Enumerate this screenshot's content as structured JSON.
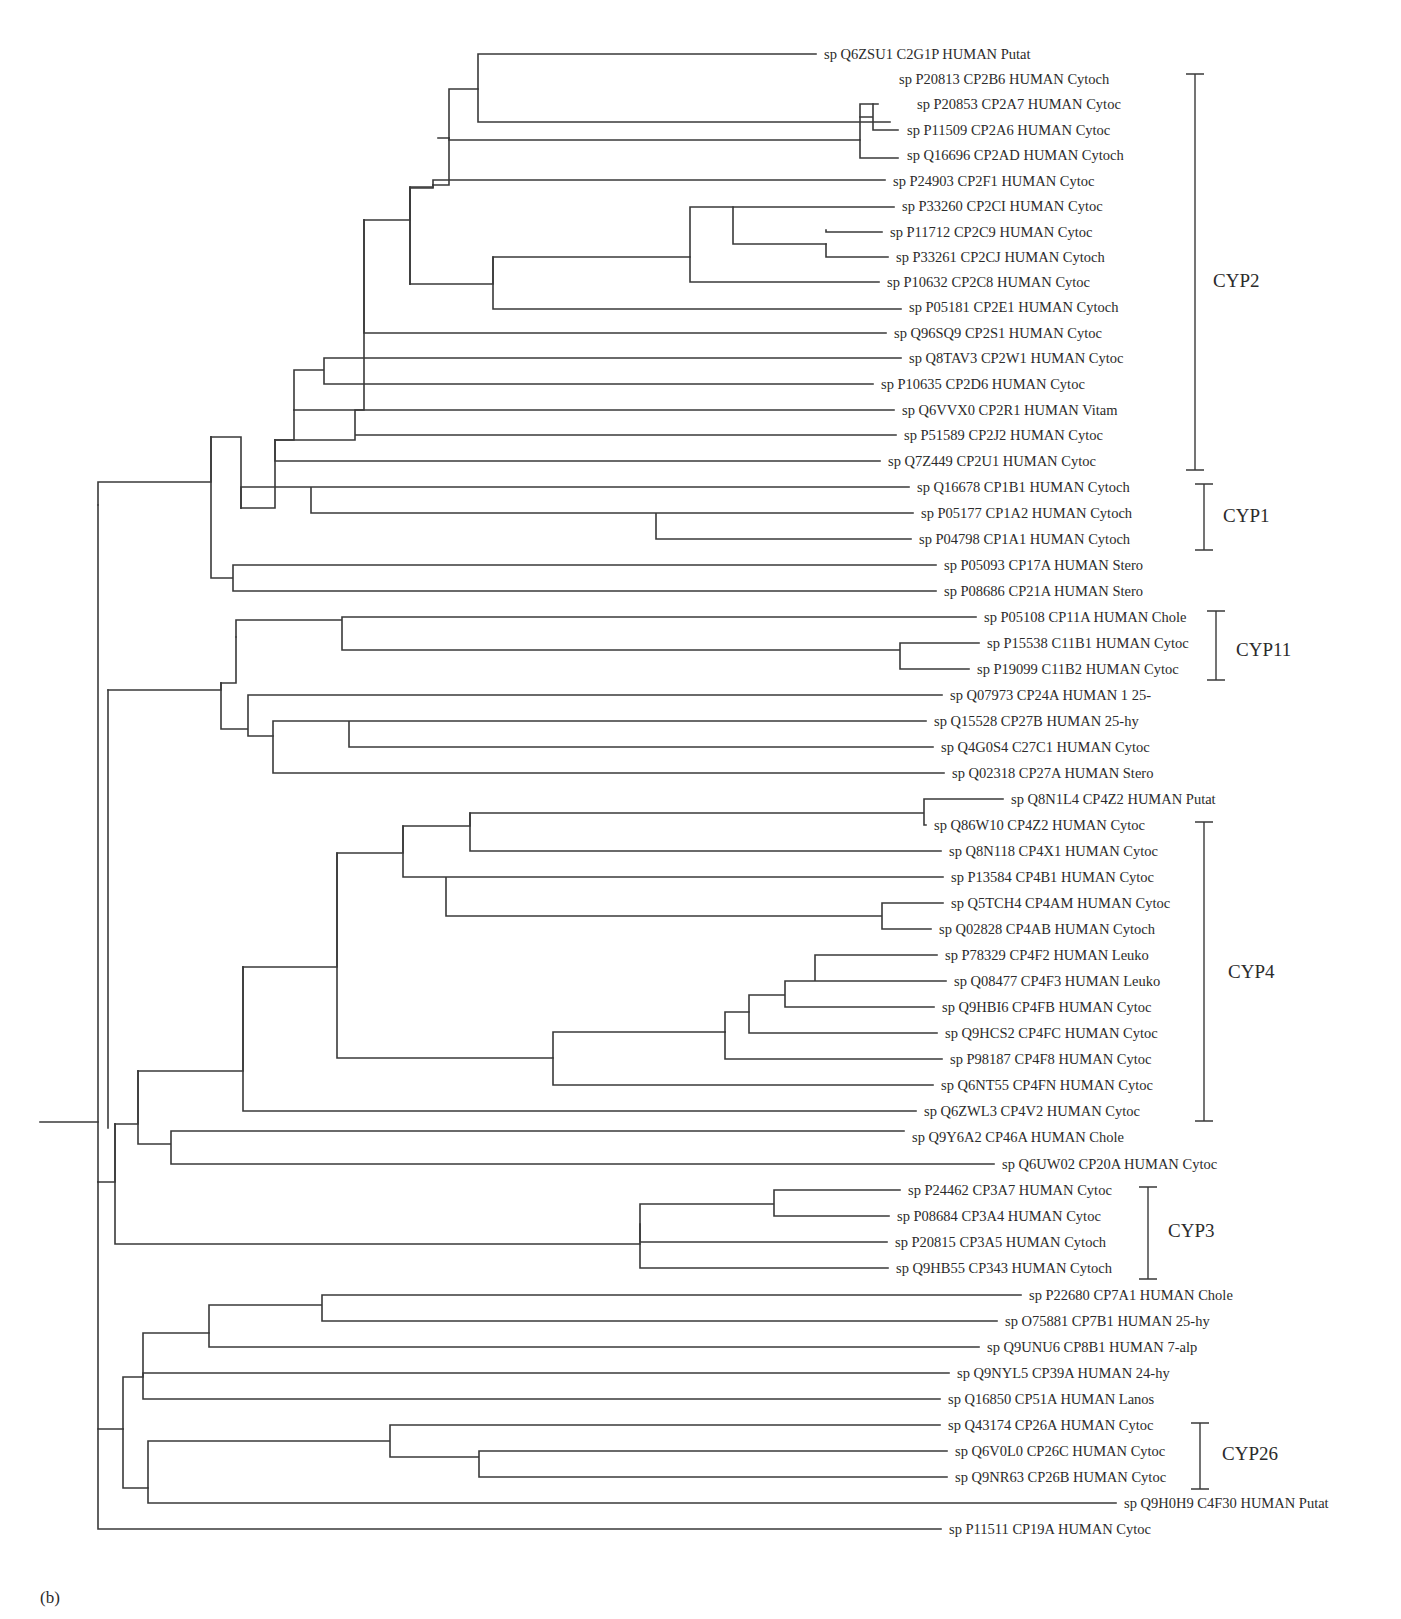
{
  "figure": {
    "panel_label": "(b)",
    "type": "phylogenetic-tree",
    "leaves": [
      {
        "id": "L0",
        "label": "sp Q6ZSU1 C2G1P HUMAN Putat",
        "y": 54,
        "x_end": 820
      },
      {
        "id": "L1",
        "label": "sp P20813 CP2B6 HUMAN Cytoch",
        "y": 79,
        "x_end": 895
      },
      {
        "id": "L2",
        "label": "sp P20853 CP2A7 HUMAN Cytoc",
        "y": 104,
        "x_end": 913
      },
      {
        "id": "L3",
        "label": "sp P11509 CP2A6 HUMAN Cytoc",
        "y": 130,
        "x_end": 903
      },
      {
        "id": "L4",
        "label": "sp Q16696 CP2AD HUMAN Cytoch",
        "y": 155,
        "x_end": 903
      },
      {
        "id": "L5",
        "label": "sp P24903 CP2F1 HUMAN Cytoc",
        "y": 181,
        "x_end": 889
      },
      {
        "id": "L6",
        "label": "sp P33260 CP2CI HUMAN Cytoc",
        "y": 206,
        "x_end": 898
      },
      {
        "id": "L7",
        "label": "sp P11712 CP2C9 HUMAN Cytoc",
        "y": 232,
        "x_end": 886
      },
      {
        "id": "L8",
        "label": "sp P33261 CP2CJ HUMAN Cytoch",
        "y": 257,
        "x_end": 892
      },
      {
        "id": "L9",
        "label": "sp P10632 CP2C8 HUMAN Cytoc",
        "y": 282,
        "x_end": 883
      },
      {
        "id": "L10",
        "label": "sp P05181 CP2E1 HUMAN Cytoch",
        "y": 307,
        "x_end": 905
      },
      {
        "id": "L11",
        "label": "sp Q96SQ9 CP2S1 HUMAN Cytoc",
        "y": 333,
        "x_end": 890
      },
      {
        "id": "L12",
        "label": "sp Q8TAV3 CP2W1 HUMAN Cytoc",
        "y": 358,
        "x_end": 905
      },
      {
        "id": "L13",
        "label": "sp P10635 CP2D6 HUMAN Cytoc",
        "y": 384,
        "x_end": 877
      },
      {
        "id": "L14",
        "label": "sp Q6VVX0 CP2R1 HUMAN Vitam",
        "y": 410,
        "x_end": 898
      },
      {
        "id": "L15",
        "label": "sp P51589 CP2J2 HUMAN Cytoc",
        "y": 435,
        "x_end": 900
      },
      {
        "id": "L16",
        "label": "sp Q7Z449 CP2U1 HUMAN Cytoc",
        "y": 461,
        "x_end": 884
      },
      {
        "id": "L17",
        "label": "sp Q16678 CP1B1 HUMAN Cytoch",
        "y": 487,
        "x_end": 913
      },
      {
        "id": "L18",
        "label": "sp P05177 CP1A2 HUMAN Cytoch",
        "y": 513,
        "x_end": 917
      },
      {
        "id": "L19",
        "label": "sp P04798 CP1A1 HUMAN Cytoch",
        "y": 539,
        "x_end": 915
      },
      {
        "id": "L20",
        "label": "sp P05093 CP17A HUMAN Stero",
        "y": 565,
        "x_end": 940
      },
      {
        "id": "L21",
        "label": "sp P08686 CP21A HUMAN Stero",
        "y": 591,
        "x_end": 940
      },
      {
        "id": "L22",
        "label": "sp P05108 CP11A HUMAN Chole",
        "y": 617,
        "x_end": 980
      },
      {
        "id": "L23",
        "label": "sp P15538 C11B1 HUMAN Cytoc",
        "y": 643,
        "x_end": 983
      },
      {
        "id": "L24",
        "label": "sp P19099 C11B2 HUMAN Cytoc",
        "y": 669,
        "x_end": 973
      },
      {
        "id": "L25",
        "label": "sp Q07973 CP24A HUMAN 1 25-",
        "y": 695,
        "x_end": 946
      },
      {
        "id": "L26",
        "label": "sp Q15528 CP27B HUMAN 25-hy",
        "y": 721,
        "x_end": 930
      },
      {
        "id": "L27",
        "label": "sp Q4G0S4 C27C1 HUMAN Cytoc",
        "y": 747,
        "x_end": 937
      },
      {
        "id": "L28",
        "label": "sp Q02318 CP27A HUMAN Stero",
        "y": 773,
        "x_end": 948
      },
      {
        "id": "L29",
        "label": "sp Q8N1L4 CP4Z2 HUMAN Putat",
        "y": 799,
        "x_end": 1007
      },
      {
        "id": "L30",
        "label": "sp Q86W10 CP4Z2 HUMAN Cytoc",
        "y": 825,
        "x_end": 930
      },
      {
        "id": "L31",
        "label": "sp Q8N118 CP4X1 HUMAN Cytoc",
        "y": 851,
        "x_end": 945
      },
      {
        "id": "L32",
        "label": "sp P13584 CP4B1 HUMAN Cytoc",
        "y": 877,
        "x_end": 947
      },
      {
        "id": "L33",
        "label": "sp Q5TCH4 CP4AM HUMAN Cytoc",
        "y": 903,
        "x_end": 947
      },
      {
        "id": "L34",
        "label": "sp Q02828 CP4AB HUMAN Cytoch",
        "y": 929,
        "x_end": 935
      },
      {
        "id": "L35",
        "label": "sp P78329 CP4F2 HUMAN Leuko",
        "y": 955,
        "x_end": 941
      },
      {
        "id": "L36",
        "label": "sp Q08477 CP4F3 HUMAN Leuko",
        "y": 981,
        "x_end": 950
      },
      {
        "id": "L37",
        "label": "sp Q9HBI6 CP4FB HUMAN Cytoc",
        "y": 1007,
        "x_end": 938
      },
      {
        "id": "L38",
        "label": "sp Q9HCS2 CP4FC HUMAN Cytoc",
        "y": 1033,
        "x_end": 941
      },
      {
        "id": "L39",
        "label": "sp P98187 CP4F8 HUMAN Cytoc",
        "y": 1059,
        "x_end": 946
      },
      {
        "id": "L40",
        "label": "sp Q6NT55 CP4FN HUMAN Cytoc",
        "y": 1085,
        "x_end": 937
      },
      {
        "id": "L41",
        "label": "sp Q6ZWL3 CP4V2 HUMAN Cytoc",
        "y": 1111,
        "x_end": 920
      },
      {
        "id": "L42",
        "label": "sp Q9Y6A2 CP46A HUMAN Chole",
        "y": 1137,
        "x_end": 908
      },
      {
        "id": "L43",
        "label": "sp Q6UW02 CP20A HUMAN Cytoc",
        "y": 1164,
        "x_end": 998
      },
      {
        "id": "L44",
        "label": "sp P24462 CP3A7 HUMAN Cytoc",
        "y": 1190,
        "x_end": 904
      },
      {
        "id": "L45",
        "label": "sp P08684 CP3A4 HUMAN Cytoc",
        "y": 1216,
        "x_end": 893
      },
      {
        "id": "L46",
        "label": "sp P20815 CP3A5 HUMAN Cytoch",
        "y": 1242,
        "x_end": 891
      },
      {
        "id": "L47",
        "label": "sp Q9HB55 CP343 HUMAN Cytoch",
        "y": 1268,
        "x_end": 892
      },
      {
        "id": "L48",
        "label": "sp P22680 CP7A1 HUMAN Chole",
        "y": 1295,
        "x_end": 1025
      },
      {
        "id": "L49",
        "label": "sp O75881 CP7B1 HUMAN 25-hy",
        "y": 1321,
        "x_end": 1001
      },
      {
        "id": "L50",
        "label": "sp Q9UNU6 CP8B1 HUMAN 7-alp",
        "y": 1347,
        "x_end": 983
      },
      {
        "id": "L51",
        "label": "sp Q9NYL5 CP39A HUMAN 24-hy",
        "y": 1373,
        "x_end": 953
      },
      {
        "id": "L52",
        "label": "sp Q16850 CP51A HUMAN Lanos",
        "y": 1399,
        "x_end": 944
      },
      {
        "id": "L53",
        "label": "sp Q43174 CP26A HUMAN Cytoc",
        "y": 1425,
        "x_end": 944
      },
      {
        "id": "L54",
        "label": "sp Q6V0L0 CP26C HUMAN Cytoc",
        "y": 1451,
        "x_end": 951
      },
      {
        "id": "L55",
        "label": "sp Q9NR63 CP26B HUMAN Cytoc",
        "y": 1477,
        "x_end": 951
      },
      {
        "id": "L56",
        "label": "sp Q9H0H9 C4F30 HUMAN Putat",
        "y": 1503,
        "x_end": 1120
      },
      {
        "id": "L57",
        "label": "sp P11511 CP19A HUMAN Cytoc",
        "y": 1529,
        "x_end": 945
      }
    ],
    "clades": [
      {
        "name": "CYP2",
        "bracket_x": 1195,
        "y_top": 74,
        "y_bottom": 470,
        "label_x": 1203,
        "label_y": 287
      },
      {
        "name": "CYP1",
        "bracket_x": 1204,
        "y_top": 484,
        "y_bottom": 550,
        "label_x": 1213,
        "label_y": 522
      },
      {
        "name": "CYP11",
        "bracket_x": 1216,
        "y_top": 611,
        "y_bottom": 680,
        "label_x": 1226,
        "label_y": 656
      },
      {
        "name": "CYP4",
        "bracket_x": 1204,
        "y_top": 822,
        "y_bottom": 1121,
        "label_x": 1218,
        "label_y": 978
      },
      {
        "name": "CYP3",
        "bracket_x": 1148,
        "y_top": 1187,
        "y_bottom": 1279,
        "label_x": 1158,
        "label_y": 1237
      },
      {
        "name": "CYP26",
        "bracket_x": 1200,
        "y_top": 1423,
        "y_bottom": 1489,
        "label_x": 1212,
        "label_y": 1460
      }
    ],
    "branches": [
      "M816 54 H478 V89 H449 V138 H438",
      "M478 89 V122 H890",
      "M449 138 V185 H433",
      "M449 138 V140 H860 V104 H878",
      "M860 117 H873 V104 M873 117 V130 H898",
      "M860 140 V158 H898",
      "M433 185 V180 H885",
      "M433 185 V188 H410 V284 H410",
      "M410 284 H493 V257 H690 V207 H733",
      "M733 207 H894 M733 207 V244 H826",
      "M826 230 V232 H882 M826 244 V257 H888",
      "M690 257 V282 H879",
      "M493 257 V309 H901",
      "M410 284 V187 M410 284 V284",
      "M364 220 H410 V187 H433",
      "M364 220 V333 H886",
      "M294 410 H364 V220",
      "M294 410 V370 H324 V358 H901 M324 370 V384 H873",
      "M294 410 V440 H275 V440",
      "M275 440 H355 V410 H894 M355 410 V435 H896",
      "M275 440 V461 H311 V461 H880",
      "M241 508 H275 V440",
      "M241 508 V487 H311 H909 M311 487 V513 H656 V513 H913 M656 513 V539 H911",
      "M211 437 H241 V508",
      "M211 437 V578 H233 V565 H936 M233 565 V591 H936",
      "M98 505 V482 H211 V437",
      "M236 637 V620 H342 V617 H976 M342 620 V650 H900 V643 H979 M900 650 V669 H969",
      "M221 683 H236 V637",
      "M221 683 V729 H248 V695 H942 M248 695 V736 H273",
      "M273 736 V721 H349 H926 M349 721 V747 H933 M273 736 V773 H310 H944",
      "M108 690 H221 V683",
      "M108 690 V1128",
      "M243 967 H337 V853 H403 V826 H470 V813 H924 V799 H1003 M924 813 V825 H926",
      "M470 813 V851 H941",
      "M403 826 V877 H446 V877 H943 M446 877 V916 H882 V903 H943 M882 916 V929 H931",
      "M337 853 V1058 H553 V1032 H725",
      "M725 1032 V1012 H749 V995 H785 V981 H815 V955 H937 M815 981 V981 H946 M785 995 V1007 H934",
      "M749 1012 V1033 H937 M725 1032 V1059 H942",
      "M553 1058 V1085 H933",
      "M243 967 V1111 H916",
      "M138 1071 H243 V967",
      "M138 1071 V1144 H171 V1131 H904 M171 1144 V1164 H994",
      "M115 1124 H138 V1071",
      "M115 1124 V1244 H640 V1204 H774 V1190 H900 M774 1204 V1216 H889",
      "M640 1224 V1242 H887 M640 1244 V1268 H888",
      "M98 1182 H115 V1124",
      "M98 1182 V505",
      "M98 1122 H40",
      "M98 1182 V1429 H123",
      "M123 1429 V1377 H143 V1333 H209 V1305 H322 V1295 H1021 M322 1305 V1321 H997",
      "M209 1333 V1347 H979 M143 1377 V1373 H949 M143 1377 V1399 H940",
      "M123 1429 V1488 H148 V1441 H390 V1425 H940 M390 1441 V1457 H479 V1451 H947 M479 1457 V1477 H947",
      "M148 1488 V1503 H1116",
      "M98 1429 V1529 H941"
    ]
  }
}
